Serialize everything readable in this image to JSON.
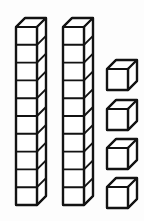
{
  "figure": {
    "description": "Two rods of ten unit cubes and four single unit cubes",
    "background_color": "#fdfdfd",
    "line_color": "#131313",
    "face_color": "#ffffff"
  },
  "blocks": {
    "rods_label": "tens rods",
    "rod_count": 2,
    "cubes_per_rod": 10,
    "singles_label": "ones cubes",
    "single_count": 4,
    "total_value": 24,
    "tens_value": 20,
    "ones_value": 4
  },
  "geometry": {
    "rods": [
      {
        "name": "tens-rod-1",
        "x": 16,
        "y": 27,
        "width": 21,
        "height": 178,
        "cells": 10,
        "depth_x": 9,
        "depth_y": -9
      },
      {
        "name": "tens-rod-2",
        "x": 63,
        "y": 27,
        "width": 21,
        "height": 178,
        "cells": 10,
        "depth_x": 9,
        "depth_y": -9
      }
    ],
    "cubes": [
      {
        "name": "ones-cube-1",
        "x": 107,
        "y": 69,
        "size": 21,
        "depth_x": 9,
        "depth_y": -9
      },
      {
        "name": "ones-cube-2",
        "x": 107,
        "y": 109,
        "size": 21,
        "depth_x": 9,
        "depth_y": -9
      },
      {
        "name": "ones-cube-3",
        "x": 107,
        "y": 148,
        "size": 21,
        "depth_x": 9,
        "depth_y": -9
      },
      {
        "name": "ones-cube-4",
        "x": 107,
        "y": 187,
        "size": 21,
        "depth_x": 9,
        "depth_y": -9
      }
    ]
  }
}
